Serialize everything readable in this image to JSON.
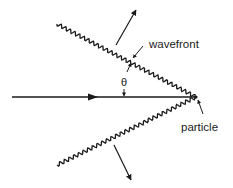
{
  "diagram": {
    "title": "",
    "labels": {
      "wavefront": "wavefront",
      "angle": "θ",
      "particle": "particle"
    },
    "colors": {
      "ink": "#1a1a1a",
      "background": "#ffffff"
    },
    "elements": [
      {
        "id": "particle-path",
        "type": "arrow-line",
        "from": [
          12,
          97
        ],
        "to": [
          196,
          97
        ]
      },
      {
        "id": "upper-wavefront",
        "type": "wavy-line",
        "from": [
          57,
          24
        ],
        "to": [
          196,
          97
        ]
      },
      {
        "id": "lower-wavefront",
        "type": "wavy-line",
        "from": [
          57,
          165
        ],
        "to": [
          196,
          97
        ]
      },
      {
        "id": "upper-propagation-arrow",
        "type": "arrow",
        "from": [
          116,
          45
        ],
        "to": [
          136,
          10
        ]
      },
      {
        "id": "lower-propagation-arrow",
        "type": "arrow",
        "from": [
          114,
          145
        ],
        "to": [
          131,
          180
        ]
      },
      {
        "id": "angle-marker",
        "type": "double-arrow",
        "label": "θ",
        "from": [
          132,
          62
        ],
        "to": [
          124,
          97
        ]
      }
    ]
  }
}
